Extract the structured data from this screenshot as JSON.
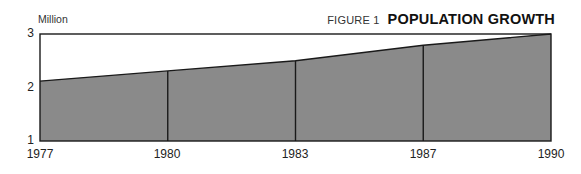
{
  "figure": {
    "label": "FIGURE 1",
    "title": "POPULATION GROWTH",
    "unit_label": "Million"
  },
  "colors": {
    "fill": "#8a8a8a",
    "line": "#1a1a1a",
    "background": "#ffffff"
  },
  "chart_data": {
    "type": "area",
    "title": "POPULATION GROWTH",
    "subtitle": "FIGURE 1",
    "xlabel": "",
    "ylabel": "Million",
    "categories": [
      "1977",
      "1980",
      "1983",
      "1987",
      "1990"
    ],
    "values": [
      2.12,
      2.31,
      2.5,
      2.79,
      3.0
    ],
    "ylim": [
      1,
      3
    ],
    "yticks": [
      "1",
      "2",
      "3"
    ],
    "grid": false,
    "legend": null,
    "annotations": "Vertical lines drawn at each intermediate data year"
  }
}
